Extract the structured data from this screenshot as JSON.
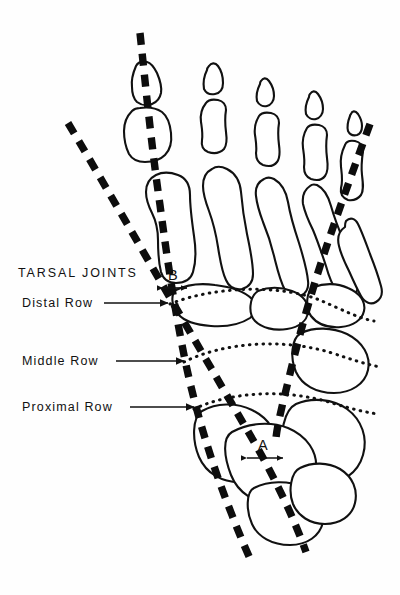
{
  "figure": {
    "background_color": "#fefefe",
    "ink_color": "#111111",
    "width": 400,
    "height": 595
  },
  "labels": {
    "tarsal_joints": "TARSAL JOINTS",
    "distal_row": "Distal Row",
    "middle_row": "Middle Row",
    "proximal_row": "Proximal Row",
    "marker_a": "A",
    "marker_b": "B"
  },
  "annotations": [
    {
      "name": "tarsal-joints",
      "text": "TARSAL JOINTS",
      "x": 18,
      "y": 277,
      "has_leader": false
    },
    {
      "name": "distal-row",
      "text": "Distal Row",
      "x": 22,
      "y": 307,
      "has_leader": true,
      "leader": {
        "x1": 108,
        "y1": 303,
        "x2": 170,
        "y2": 303
      }
    },
    {
      "name": "middle-row",
      "text": "Middle Row",
      "x": 22,
      "y": 365,
      "has_leader": true,
      "leader": {
        "x1": 117,
        "y1": 361,
        "x2": 186,
        "y2": 361
      }
    },
    {
      "name": "proximal-row",
      "text": "Proximal Row",
      "x": 22,
      "y": 411,
      "has_leader": true,
      "leader": {
        "x1": 132,
        "y1": 407,
        "x2": 196,
        "y2": 407
      }
    }
  ],
  "measurements": [
    {
      "name": "angle-a",
      "label": "A",
      "label_x": 262,
      "label_y": 447,
      "arrow": {
        "x1": 247,
        "y1": 458,
        "x2": 281,
        "y2": 458
      },
      "description": "double-headed arrow between the two axis lines at the proximal row"
    },
    {
      "name": "angle-b",
      "label": "B",
      "label_x": 170,
      "label_y": 277,
      "arrow": {
        "x1": 163,
        "y1": 288,
        "x2": 186,
        "y2": 288
      },
      "description": "double-headed arrow between the two axis lines at the tarsal joints"
    }
  ],
  "axes": [
    {
      "name": "axis-line-left",
      "points": "141,34 150,120 158,200 168,278 178,355 196,430 218,497 243,560"
    },
    {
      "name": "axis-line-right",
      "points": "70,125 110,195 146,262 176,320 208,380 243,440 272,497 300,556"
    },
    {
      "name": "axis-line-lateral",
      "points": "367,127 350,170 332,214 318,258 305,300 292,345 280,395 277,436"
    }
  ],
  "row_arcs": [
    {
      "name": "distal-row-arc",
      "path": "M 172,304 C 215,286 282,285 322,302 C 345,312 358,318 372,320"
    },
    {
      "name": "middle-row-arc",
      "path": "M 186,362 C 224,343 282,339 330,354 C 352,361 364,364 378,366"
    },
    {
      "name": "proximal-row-arc",
      "path": "M 196,409 C 232,392 286,390 330,404 C 350,410 362,412 376,413"
    }
  ],
  "bone_groups": [
    {
      "name": "hallux-phalanges",
      "count": 2
    },
    {
      "name": "lesser-toe-phalanges",
      "count": 12
    },
    {
      "name": "metatarsals",
      "count": 5
    },
    {
      "name": "tarsals-distal-row",
      "count": 3
    },
    {
      "name": "tarsals-middle-row",
      "count": 1
    },
    {
      "name": "tarsals-proximal-row",
      "count": 3
    }
  ]
}
